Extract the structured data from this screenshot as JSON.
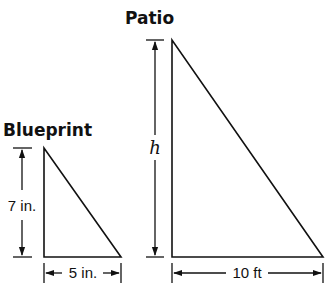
{
  "figures": {
    "blueprint": {
      "title": "Blueprint",
      "height_label": "7 in.",
      "base_label": "5 in."
    },
    "patio": {
      "title": "Patio",
      "height_label": "h",
      "base_label": "10 ft"
    }
  },
  "colors": {
    "stroke": "#111111",
    "background": "#ffffff"
  }
}
